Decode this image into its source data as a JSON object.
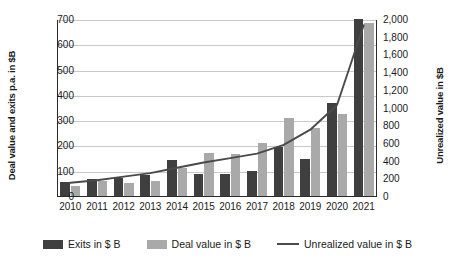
{
  "chart_data": {
    "type": "bar",
    "title": "",
    "xlabel": "",
    "ylabel": "Deal value and exits p.a. in $B",
    "y2label": "Unrealized value in $B",
    "categories": [
      "2010",
      "2011",
      "2012",
      "2013",
      "2014",
      "2015",
      "2016",
      "2017",
      "2018",
      "2019",
      "2020",
      "2021"
    ],
    "ylim": [
      0,
      700
    ],
    "y2lim": [
      0,
      2000
    ],
    "yticks": [
      "0",
      "100",
      "200",
      "300",
      "400",
      "500",
      "600",
      "700"
    ],
    "ytick_values": [
      0,
      100,
      200,
      300,
      400,
      500,
      600,
      700
    ],
    "y2ticks": [
      "0",
      "200",
      "400",
      "600",
      "800",
      "1,000",
      "1,200",
      "1,400",
      "1,600",
      "1,800",
      "2,000"
    ],
    "y2tick_values": [
      0,
      200,
      400,
      600,
      800,
      1000,
      1200,
      1400,
      1600,
      1800,
      2000
    ],
    "grid": true,
    "legend_position": "bottom",
    "series": [
      {
        "name": "Exits in $ B",
        "type": "bar",
        "axis": "left",
        "color": "#3f3f3f",
        "values": [
          60,
          72,
          74,
          87,
          148,
          93,
          91,
          102,
          196,
          150,
          370,
          706
        ]
      },
      {
        "name": "Deal value in $ B",
        "type": "bar",
        "axis": "left",
        "color": "#a9a9a9",
        "values": [
          43,
          62,
          57,
          63,
          116,
          173,
          172,
          214,
          311,
          274,
          329,
          689
        ]
      },
      {
        "name": "Unrealized value in $ B",
        "type": "line",
        "axis": "right",
        "color": "#4a4a4a",
        "values": [
          160,
          190,
          230,
          270,
          330,
          390,
          440,
          490,
          590,
          760,
          1040,
          1940
        ]
      }
    ]
  },
  "legend": {
    "items": [
      {
        "label": "Exits in $ B",
        "marker": "bar-dark-swatch"
      },
      {
        "label": "Deal value in $ B",
        "marker": "bar-light-swatch"
      },
      {
        "label": "Unrealized value in $ B",
        "marker": "line-swatch"
      }
    ]
  }
}
